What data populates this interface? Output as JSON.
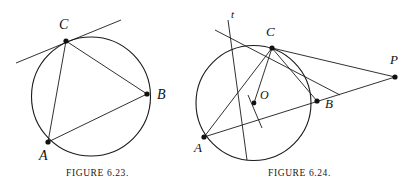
{
  "page": {
    "width": 409,
    "height": 189,
    "background": "#ffffff",
    "ink": "#1a1a1a"
  },
  "figures": [
    {
      "id": "figure-6-23",
      "caption": "FIGURE 6.23.",
      "circle": {
        "cx": 91,
        "cy": 96.5,
        "r": 59.5
      },
      "points": [
        {
          "name": "C",
          "x": 66,
          "y": 41,
          "label": "C",
          "label_x": 59,
          "label_y": 29
        },
        {
          "name": "B",
          "x": 147,
          "y": 94,
          "label": "B",
          "label_x": 157,
          "label_y": 99
        },
        {
          "name": "A",
          "x": 48,
          "y": 142,
          "label": "A",
          "label_x": 39,
          "label_y": 160
        }
      ],
      "segments": [
        {
          "name": "chord-CA",
          "from": "C",
          "to": "A"
        },
        {
          "name": "chord-CB",
          "from": "C",
          "to": "B"
        },
        {
          "name": "chord-AB",
          "from": "A",
          "to": "B"
        }
      ],
      "lines": [
        {
          "name": "tangent-at-C",
          "x1": 16,
          "y1": 63,
          "x2": 121,
          "y2": 20
        }
      ]
    },
    {
      "id": "figure-6-24",
      "caption": "FIGURE 6.24.",
      "circle": {
        "cx": 253.5,
        "cy": 103,
        "r": 57.5
      },
      "points": [
        {
          "name": "C",
          "x": 272,
          "y": 48,
          "label": "C",
          "label_x": 266,
          "label_y": 36
        },
        {
          "name": "O",
          "x": 254,
          "y": 103,
          "label": "O",
          "label_x": 260,
          "label_y": 99
        },
        {
          "name": "B",
          "x": 317,
          "y": 101,
          "label": "B",
          "label_x": 325,
          "label_y": 108
        },
        {
          "name": "A",
          "x": 204,
          "y": 137,
          "label": "A",
          "label_x": 194,
          "label_y": 152
        },
        {
          "name": "P",
          "x": 395,
          "y": 77,
          "label": "P",
          "label_x": 390,
          "label_y": 64
        }
      ],
      "segments": [
        {
          "name": "chord-CA",
          "from": "C",
          "to": "A"
        },
        {
          "name": "chord-CB",
          "from": "C",
          "to": "B"
        },
        {
          "name": "radius-CO",
          "from": "C",
          "to": "O"
        },
        {
          "name": "tangent-CP",
          "from": "C",
          "to": "P"
        },
        {
          "name": "secant-AP",
          "from": "A",
          "to": "P"
        }
      ],
      "lines": [
        {
          "name": "tangent-line-at-C",
          "x1": 215,
          "y1": 30,
          "x2": 340,
          "y2": 95
        },
        {
          "name": "line-t",
          "x1": 228,
          "y1": 20,
          "x2": 247,
          "y2": 160
        },
        {
          "name": "segment-through-O",
          "x1": 248,
          "y1": 95,
          "x2": 262,
          "y2": 128
        }
      ],
      "annotations": [
        {
          "name": "line-label-t",
          "text": "t",
          "x": 231,
          "y": 18
        }
      ]
    }
  ]
}
